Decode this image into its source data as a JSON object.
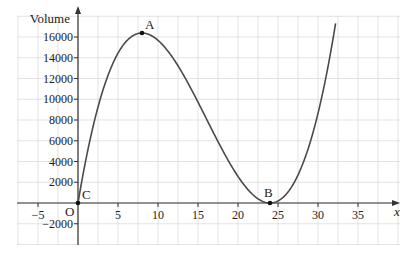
{
  "chart_data": {
    "type": "line",
    "title": "",
    "xlabel": "x",
    "ylabel": "Volume",
    "xlim": [
      -7.5,
      40
    ],
    "ylim": [
      -4000,
      18000
    ],
    "grid": true,
    "grid_x_step": 2.5,
    "grid_y_step": 2000,
    "x_ticks": [
      -5,
      5,
      10,
      15,
      20,
      25,
      30,
      35
    ],
    "x_tick_labels": [
      "−5",
      "5",
      "10",
      "15",
      "20",
      "25",
      "30",
      "35"
    ],
    "y_ticks": [
      -2000,
      2000,
      4000,
      6000,
      8000,
      10000,
      12000,
      14000,
      16000
    ],
    "y_tick_labels": [
      "−2000",
      "2000",
      "4000",
      "6000",
      "8000",
      "10000",
      "12000",
      "14000",
      "16000"
    ],
    "origin_label": "O",
    "series": [
      {
        "name": "Volume curve",
        "formula": "V = 8x(24 - x)^2",
        "x_range": [
          0,
          32.2
        ],
        "x": [
          0,
          2,
          4,
          6,
          8,
          10,
          12,
          14,
          16,
          18,
          20,
          22,
          24,
          26,
          28,
          30,
          32
        ],
        "values": [
          0,
          7744,
          12800,
          15552,
          16384,
          15680,
          13824,
          11200,
          8192,
          5184,
          2560,
          704,
          0,
          832,
          3584,
          8640,
          16384
        ]
      }
    ],
    "points": [
      {
        "label": "A",
        "x": 8,
        "y": 16384
      },
      {
        "label": "B",
        "x": 24,
        "y": 0
      },
      {
        "label": "C",
        "x": 0,
        "y": 0
      }
    ]
  }
}
